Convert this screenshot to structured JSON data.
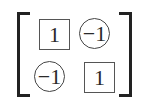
{
  "matrix": {
    "rows": [
      [
        {
          "value": "1",
          "shape": "box"
        },
        {
          "value": "−1",
          "shape": "circle"
        }
      ],
      [
        {
          "value": "−1",
          "shape": "circle"
        },
        {
          "value": "1",
          "shape": "box"
        }
      ]
    ]
  }
}
